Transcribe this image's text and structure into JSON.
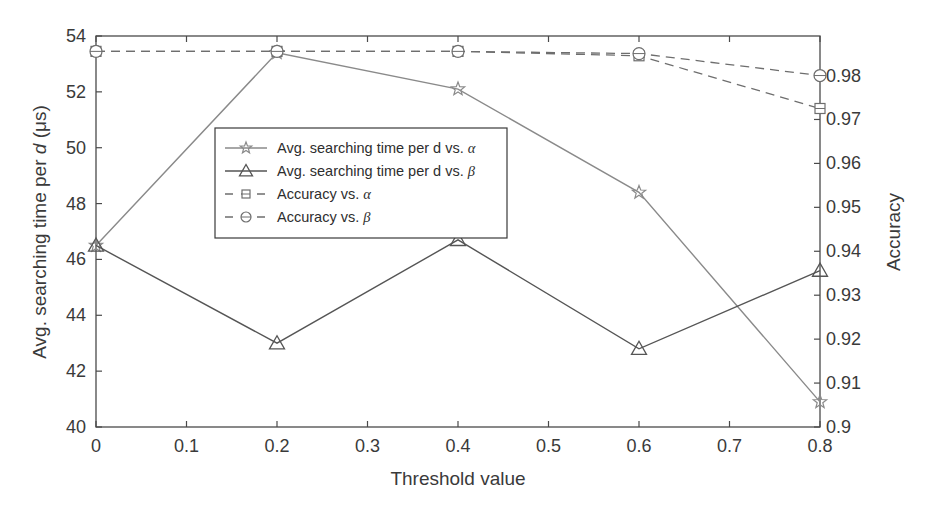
{
  "chart_data": {
    "type": "line",
    "title": "",
    "xlabel": "Threshold value",
    "ylabel": "Avg. searching time per d (μs)",
    "ylabel_parts": {
      "pre": "Avg. searching time per ",
      "italic": "d",
      "post": " (μs)"
    },
    "y2label": "Accuracy",
    "x": [
      0,
      0.2,
      0.4,
      0.6,
      0.8
    ],
    "xlim": [
      0,
      0.8
    ],
    "xticks": [
      "0",
      "0.1",
      "0.2",
      "0.3",
      "0.4",
      "0.5",
      "0.6",
      "0.7",
      "0.8"
    ],
    "ylim": [
      40,
      54
    ],
    "yticks": [
      "40",
      "42",
      "44",
      "46",
      "48",
      "50",
      "52",
      "54"
    ],
    "y2lim": [
      0.9,
      0.989
    ],
    "y2ticks": [
      "0.9",
      "0.91",
      "0.92",
      "0.93",
      "0.94",
      "0.95",
      "0.96",
      "0.97",
      "0.98"
    ],
    "grid": false,
    "legend_position": "upper-left-center",
    "series": [
      {
        "name": "Avg. searching time per d vs. α",
        "label_pre": "Avg. searching time per d vs. ",
        "greek": "α",
        "axis": "left",
        "marker": "star",
        "linestyle": "solid",
        "color": "#8a8a8a",
        "values": [
          46.5,
          53.4,
          52.1,
          48.4,
          40.9
        ]
      },
      {
        "name": "Avg. searching time per d vs. β",
        "label_pre": "Avg. searching time per d vs. ",
        "greek": "β",
        "axis": "left",
        "marker": "triangle",
        "linestyle": "solid",
        "color": "#555555",
        "values": [
          46.5,
          43.0,
          46.7,
          42.8,
          45.6
        ]
      },
      {
        "name": "Accuracy vs. α",
        "label_pre": "Accuracy vs. ",
        "greek": "α",
        "axis": "right",
        "marker": "square",
        "linestyle": "dashed",
        "color": "#6e6e6e",
        "values": [
          0.9855,
          0.9855,
          0.9855,
          0.9845,
          0.9725
        ]
      },
      {
        "name": "Accuracy vs. β",
        "label_pre": "Accuracy vs. ",
        "greek": "β",
        "axis": "right",
        "marker": "circle",
        "linestyle": "dashed",
        "color": "#6e6e6e",
        "values": [
          0.9855,
          0.9855,
          0.9855,
          0.985,
          0.98
        ]
      }
    ]
  }
}
